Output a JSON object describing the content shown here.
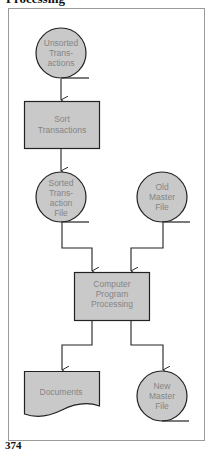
{
  "heading": "Processing",
  "page_number": "374",
  "colors": {
    "shape_fill": "#c9c9c9",
    "stroke": "#222222",
    "label_text": "#858585",
    "frame": "#9a9a9a"
  },
  "nodes": [
    {
      "id": "unsorted",
      "type": "magnetic-tape",
      "lines": [
        "Unsorted",
        "Trans-",
        "actions"
      ]
    },
    {
      "id": "sort",
      "type": "process",
      "lines": [
        "Sort",
        "Transactions"
      ]
    },
    {
      "id": "sorted",
      "type": "magnetic-tape",
      "lines": [
        "Sorted",
        "Trans-",
        "action",
        "File"
      ]
    },
    {
      "id": "old_master",
      "type": "magnetic-tape",
      "lines": [
        "Old",
        "Master",
        "File"
      ]
    },
    {
      "id": "processing",
      "type": "process",
      "lines": [
        "Computer",
        "Program",
        "Processing"
      ]
    },
    {
      "id": "documents",
      "type": "document",
      "lines": [
        "Documents"
      ]
    },
    {
      "id": "new_master",
      "type": "magnetic-tape",
      "lines": [
        "New",
        "Master",
        "File"
      ]
    }
  ],
  "edges": [
    {
      "from": "unsorted",
      "to": "sort"
    },
    {
      "from": "sort",
      "to": "sorted"
    },
    {
      "from": "sorted",
      "to": "processing"
    },
    {
      "from": "old_master",
      "to": "processing"
    },
    {
      "from": "processing",
      "to": "documents"
    },
    {
      "from": "processing",
      "to": "new_master"
    }
  ]
}
